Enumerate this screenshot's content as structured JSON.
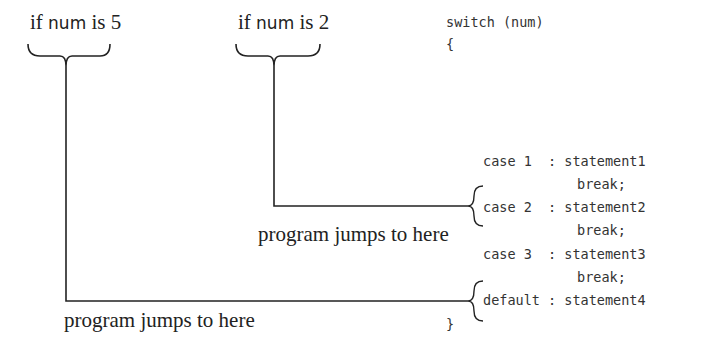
{
  "labels": {
    "left_condition": {
      "pre": "if ",
      "var": "num",
      "post": " is 5"
    },
    "right_condition": {
      "pre": "if ",
      "var": "num",
      "post": " is 2"
    },
    "jump_label_case2": "program jumps to here",
    "jump_label_default": "program jumps to here"
  },
  "code": {
    "switch_line": "switch (num)",
    "open_brace": "{",
    "close_brace": "}",
    "cases": [
      {
        "label": "case 1  ",
        "sep": ": ",
        "statement": "statement1",
        "break": "break;"
      },
      {
        "label": "case 2  ",
        "sep": ": ",
        "statement": "statement2",
        "break": "break;"
      },
      {
        "label": "case 3  ",
        "sep": ": ",
        "statement": "statement3",
        "break": "break;"
      },
      {
        "label": "default ",
        "sep": ": ",
        "statement": "statement4"
      }
    ]
  }
}
